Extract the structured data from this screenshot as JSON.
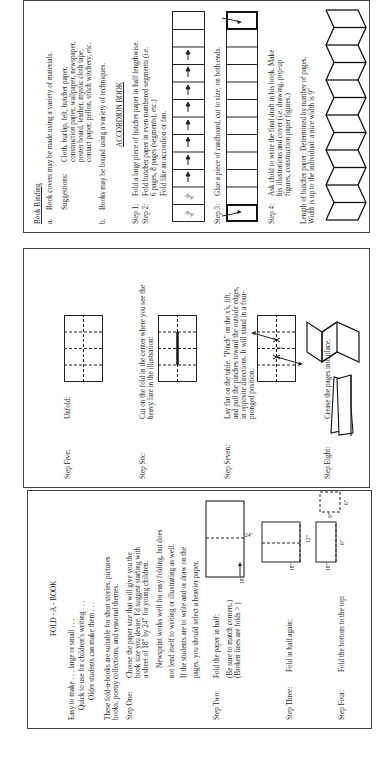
{
  "book_binding": {
    "title": "Book Binding",
    "item_a_marker": "a.",
    "item_a": "Book covers may be made using a variety of materials.",
    "suggestions_label": "Suggestions:",
    "suggestions_lines": [
      "Cloth, burlap, felt, butcher paper,",
      "construction paper, wallpaper, newspaper,",
      "poster board, leather, mystic cloth tape,",
      "contact paper, pellon, stitch witchery, etc."
    ],
    "item_b_marker": "b.",
    "item_b": "Books may be bound using a variety of techniques.",
    "accordion_title": "ACCORDION BOOK",
    "step1_label": "Step 1:",
    "step1_text": "Fold a large piece of butcher paper in half lengthwise.",
    "step2_label": "Step 2:",
    "step2_lines": [
      "Fold butcher paper in even numbered segments (i.e.",
      "6 pages, 8 pages (segments), etc.)"
    ],
    "step2_sub": "Fold like an accordion or fan.",
    "fold_mark": "fold",
    "step3_label": "Step 3:",
    "step3_text": "Glue a piece of cardboard, cut to size, on both ends.",
    "step4_label": "Step 4:",
    "step4_lines": [
      "Ask child to write the final draft in his book. Make",
      "his illustrations and cover (i.e. drawing, pop-up",
      "figures, construction paper figures.)"
    ],
    "length_lines": [
      "Length of butcher paper: Determined by number of pages.",
      "Width is up to the individual: a nice width is 9\""
    ]
  },
  "steps_five_to_eight": {
    "step5_label": "Step Five:",
    "step5_text": "Unfold:",
    "step6_label": "Step Six:",
    "step6_lines": [
      "Cut on the fold in the center where you see the",
      "heavy line in the illustration:"
    ],
    "step7_label": "Step Seven:",
    "step7_lines": [
      "Lay flat on the table. \"Pinch\" on the x's, lift,",
      "and pull the pinches toward the outside edges,",
      "in opposite directions. It will stand in a four-",
      "pronged position."
    ],
    "cut_mark": "cut",
    "step8_label": "Step Eight:",
    "step8_text": "Crease the pages into place."
  },
  "fold_a_book": {
    "title": "FOLD - A - BOOK",
    "intro_lines": [
      "Easy to make . . . large or small . . .",
      "Quick to use for children's writing . . .",
      "Older students can make them . . ."
    ],
    "suitable_lines": [
      "These fold-a-books are suitable for short stories, pictures",
      "books, poetry collections, and seasonal themes."
    ],
    "step1_label": "Step One:",
    "step1_lines": [
      "Choose the paper size that will give you the",
      "book size you desire. I'd suggest starting with",
      "a sheet of 18\" by 24\" for young children."
    ],
    "newsprint_lines": [
      "Newsprint works well for easy folding, but does",
      "not lend itself to writing or illustrating as well.",
      "If the students are to write and/or draw on the",
      "pages, you should select a heavier paper."
    ],
    "step2_label": "Step Two:",
    "step2_text": "Fold the paper in half:",
    "step2_note_lines": [
      "(Be sure to match corners.)",
      "(Broken lines are folds > )"
    ],
    "step3_label": "Step Three:",
    "step3_text": "Fold in half again:",
    "step4_label": "Step Four:",
    "step4_text": "Fold the bottom to the top:",
    "dims": {
      "d24": "24\"",
      "d18": "18\"",
      "d12": "12\"",
      "d18b": "18\"",
      "d6a": "6\"",
      "d18c": "18\"",
      "d6b": "6\"",
      "d9": "9\""
    }
  }
}
